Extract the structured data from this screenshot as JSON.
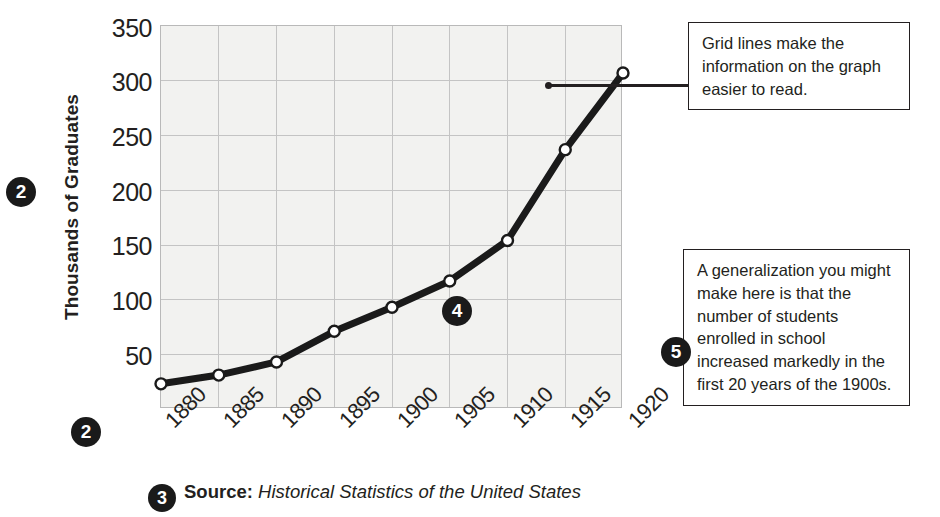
{
  "chart_data": {
    "type": "line",
    "title": "",
    "xlabel": "",
    "ylabel": "Thousands of Graduates",
    "categories": [
      "1880",
      "1885",
      "1890",
      "1895",
      "1900",
      "1905",
      "1910",
      "1915",
      "1920"
    ],
    "x": [
      1880,
      1885,
      1890,
      1895,
      1900,
      1905,
      1910,
      1915,
      1920
    ],
    "values": [
      23,
      31,
      43,
      71,
      93,
      117,
      154,
      237,
      307
    ],
    "series": [
      {
        "name": "High school graduates",
        "values": [
          23,
          31,
          43,
          71,
          93,
          117,
          154,
          237,
          307
        ]
      }
    ],
    "ylim": [
      0,
      350
    ],
    "xlim": [
      1880,
      1920
    ],
    "y_ticks": [
      50,
      100,
      150,
      200,
      250,
      300,
      350
    ],
    "grid": true,
    "legend": "none",
    "marker": "open-circle",
    "line_color": "#1a1a1a",
    "plot_background": "#f2f2f0",
    "grid_color": "#c4c4c4"
  },
  "axis": {
    "y_title": "Thousands of Graduates",
    "y_ticks": [
      "350",
      "300",
      "250",
      "200",
      "150",
      "100",
      "50"
    ],
    "x_ticks": [
      "1880",
      "1885",
      "1890",
      "1895",
      "1900",
      "1905",
      "1910",
      "1915",
      "1920"
    ]
  },
  "badges": {
    "y_axis": "2",
    "x_axis": "2",
    "source": "3",
    "plot": "4",
    "generalization": "5"
  },
  "callouts": {
    "gridlines": "Grid lines make the information on the graph easier to read.",
    "generalization": "A generalization you might make here is that the number of students enrolled in school increased markedly in the first 20 years of the 1900s."
  },
  "source": {
    "label": "Source:",
    "title": "Historical Statistics of the United States"
  }
}
